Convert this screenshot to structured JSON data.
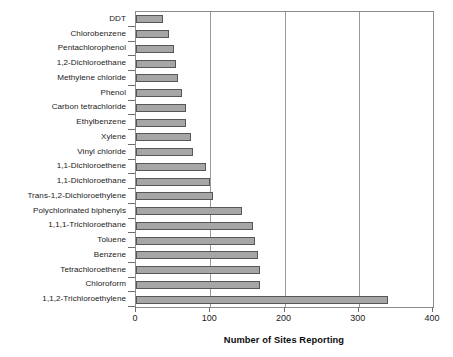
{
  "chart_data": {
    "type": "bar",
    "orientation": "horizontal",
    "title": "",
    "xlabel": "Number of Sites Reporting",
    "ylabel": "",
    "xlim": [
      0,
      400
    ],
    "xticks": [
      0,
      100,
      200,
      300,
      400
    ],
    "grid": "vertical",
    "legend": "none",
    "categories": [
      "DDT",
      "Chlorobenzene",
      "Pentachlorophenol",
      "1,2-Dichloroethane",
      "Methylene chloride",
      "Phenol",
      "Carbon tetrachloride",
      "Ethylbenzene",
      "Xylene",
      "Vinyl chloride",
      "1,1-Dichloroethene",
      "1,1-Dichloroethane",
      "Trans-1,2-Dichloroethylene",
      "Polychlorinated biphenyls",
      "1,1,1-Trichloroethane",
      "Toluene",
      "Benzene",
      "Tetrachloroethene",
      "Chloroform",
      "1,1,2-Trichloroethylene"
    ],
    "values": [
      36,
      44,
      51,
      54,
      57,
      62,
      67,
      67,
      74,
      77,
      94,
      100,
      104,
      143,
      157,
      160,
      164,
      167,
      167,
      339
    ],
    "bar_fill_color": "#a6a6a6",
    "bar_border_color": "#575757",
    "axis_color": "#8c8c8c",
    "grid_color": "#9a9a9a"
  }
}
